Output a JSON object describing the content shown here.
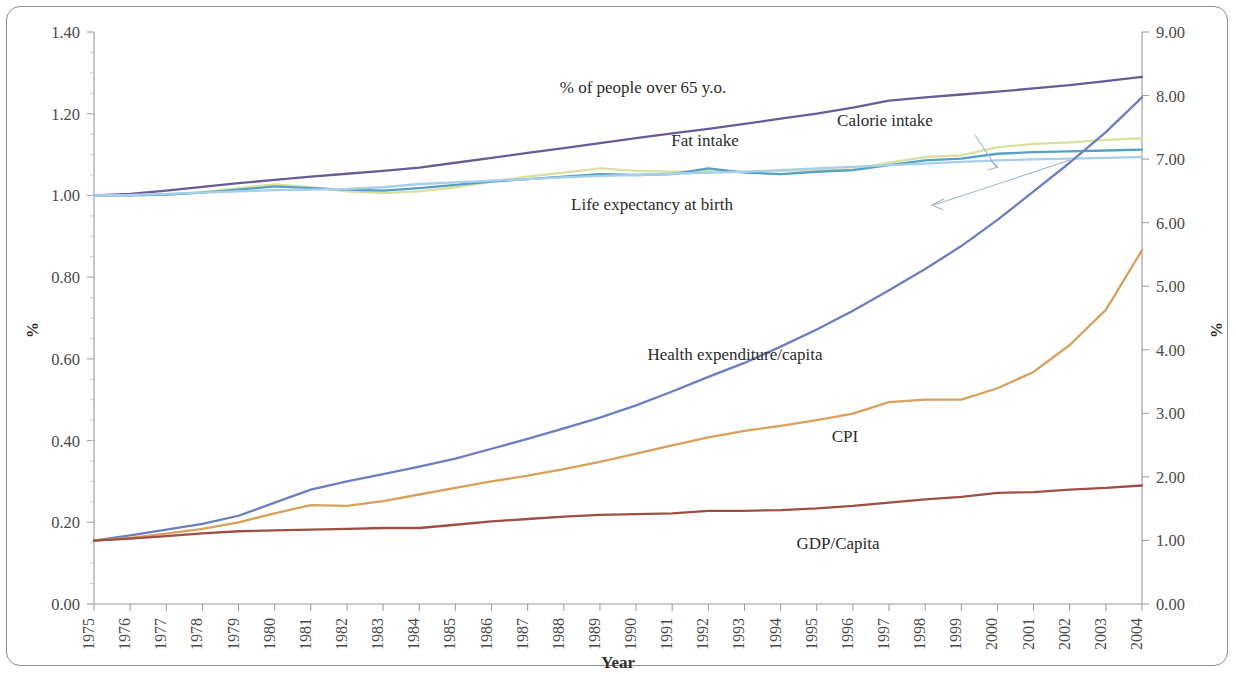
{
  "chart_data": {
    "type": "line",
    "title": "",
    "xlabel": "Year",
    "ylabel": "%",
    "ylabel_right": "%",
    "grid": false,
    "legend_position": "inline-annotations",
    "x": [
      1975,
      1976,
      1977,
      1978,
      1979,
      1980,
      1981,
      1982,
      1983,
      1984,
      1985,
      1986,
      1987,
      1988,
      1989,
      1990,
      1991,
      1992,
      1993,
      1994,
      1995,
      1996,
      1997,
      1998,
      1999,
      2000,
      2001,
      2002,
      2003,
      2004
    ],
    "xtick_labels": [
      "1975",
      "1976",
      "1977",
      "1978",
      "1979",
      "1980",
      "1981",
      "1982",
      "1983",
      "1984",
      "1985",
      "1986",
      "1987",
      "1988",
      "1989",
      "1990",
      "1991",
      "1992",
      "1993",
      "1994",
      "1995",
      "1996",
      "1997",
      "1998",
      "1999",
      "2000",
      "2001",
      "2002",
      "2003",
      "2004"
    ],
    "ylim": [
      0.0,
      1.4
    ],
    "ytick_labels": [
      "0.00",
      "0.20",
      "0.40",
      "0.60",
      "0.80",
      "1.00",
      "1.20",
      "1.40"
    ],
    "ytick_values": [
      0.0,
      0.2,
      0.4,
      0.6,
      0.8,
      1.0,
      1.2,
      1.4
    ],
    "ylim_right": [
      0.0,
      9.0
    ],
    "ytick_labels_right": [
      "0.00",
      "1.00",
      "2.00",
      "3.00",
      "4.00",
      "5.00",
      "6.00",
      "7.00",
      "8.00",
      "9.00"
    ],
    "ytick_values_right": [
      0,
      1,
      2,
      3,
      4,
      5,
      6,
      7,
      8,
      9
    ],
    "series": [
      {
        "name": "% of people over 65 y.o.",
        "color": "#6b5b95",
        "axis": "left",
        "values": [
          1.0,
          1.004,
          1.012,
          1.021,
          1.03,
          1.038,
          1.046,
          1.053,
          1.06,
          1.068,
          1.08,
          1.092,
          1.104,
          1.116,
          1.128,
          1.14,
          1.152,
          1.163,
          1.175,
          1.188,
          1.2,
          1.215,
          1.232,
          1.24,
          1.247,
          1.254,
          1.262,
          1.27,
          1.28,
          1.29
        ]
      },
      {
        "name": "Calorie intake",
        "color": "#d7e2a0",
        "axis": "left",
        "values": [
          1.0,
          1.0,
          1.002,
          1.008,
          1.018,
          1.027,
          1.02,
          1.01,
          1.006,
          1.01,
          1.02,
          1.034,
          1.046,
          1.056,
          1.066,
          1.06,
          1.058,
          1.06,
          1.058,
          1.06,
          1.062,
          1.064,
          1.08,
          1.094,
          1.098,
          1.118,
          1.126,
          1.13,
          1.136,
          1.14
        ]
      },
      {
        "name": "Fat intake",
        "color": "#56a0c8",
        "axis": "left",
        "values": [
          1.0,
          1.0,
          1.002,
          1.007,
          1.014,
          1.022,
          1.018,
          1.014,
          1.012,
          1.018,
          1.026,
          1.034,
          1.04,
          1.046,
          1.052,
          1.05,
          1.052,
          1.066,
          1.056,
          1.052,
          1.058,
          1.062,
          1.074,
          1.086,
          1.09,
          1.102,
          1.106,
          1.108,
          1.11,
          1.112
        ]
      },
      {
        "name": "Life expectancy at birth",
        "color": "#a8cfea",
        "axis": "left",
        "values": [
          1.0,
          1.001,
          1.004,
          1.007,
          1.01,
          1.013,
          1.014,
          1.016,
          1.02,
          1.028,
          1.032,
          1.036,
          1.04,
          1.044,
          1.048,
          1.05,
          1.053,
          1.056,
          1.058,
          1.062,
          1.066,
          1.07,
          1.074,
          1.078,
          1.082,
          1.086,
          1.088,
          1.09,
          1.092,
          1.094
        ]
      },
      {
        "name": "Health expenditure/capita",
        "color": "#6a7fc0",
        "axis": "left",
        "values": [
          0.155,
          0.168,
          0.182,
          0.196,
          0.216,
          0.248,
          0.28,
          0.3,
          0.318,
          0.336,
          0.356,
          0.38,
          0.404,
          0.43,
          0.456,
          0.486,
          0.52,
          0.556,
          0.59,
          0.63,
          0.672,
          0.718,
          0.768,
          0.82,
          0.876,
          0.94,
          1.01,
          1.08,
          1.155,
          1.24
        ]
      },
      {
        "name": "CPI",
        "color": "#d9a05b",
        "axis": "left",
        "values": [
          0.155,
          0.162,
          0.172,
          0.184,
          0.2,
          0.222,
          0.242,
          0.24,
          0.252,
          0.268,
          0.284,
          0.3,
          0.314,
          0.33,
          0.348,
          0.368,
          0.388,
          0.408,
          0.424,
          0.436,
          0.45,
          0.466,
          0.494,
          0.5,
          0.5,
          0.528,
          0.568,
          0.634,
          0.72,
          0.866
        ]
      },
      {
        "name": "GDP/Capita",
        "color": "#9e4f42",
        "axis": "left",
        "values": [
          0.155,
          0.16,
          0.166,
          0.173,
          0.178,
          0.18,
          0.182,
          0.184,
          0.186,
          0.186,
          0.194,
          0.202,
          0.208,
          0.214,
          0.218,
          0.22,
          0.222,
          0.228,
          0.228,
          0.23,
          0.234,
          0.24,
          0.248,
          0.256,
          0.262,
          0.272,
          0.274,
          0.28,
          0.284,
          0.29
        ]
      }
    ],
    "annotations": [
      {
        "text": "% of people over 65 y.o.",
        "x": 643,
        "y": 93
      },
      {
        "text": "Calorie intake",
        "x": 885,
        "y": 126
      },
      {
        "text": "Fat intake",
        "x": 705,
        "y": 146
      },
      {
        "text": "Life expectancy at birth",
        "x": 652,
        "y": 210
      },
      {
        "text": "Health expenditure/capita",
        "x": 735,
        "y": 360
      },
      {
        "text": "CPI",
        "x": 845,
        "y": 442
      },
      {
        "text": "GDP/Capita",
        "x": 838,
        "y": 549
      }
    ]
  }
}
